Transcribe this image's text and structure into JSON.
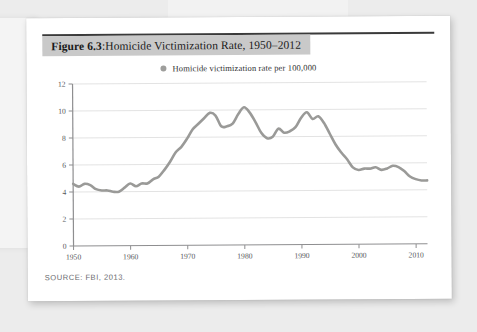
{
  "figure": {
    "label": "Figure 6.3",
    "separator": ": ",
    "title": "Homicide Victimization Rate, 1950–2012",
    "source": "SOURCE: FBI, 2013."
  },
  "colors": {
    "line": "#9a9a98",
    "title_band": "#c9c9c9",
    "grid": "#e3e3e3",
    "axis": "#8e8e90",
    "tick_text": "#55565a",
    "card": "#ffffff",
    "page_background": "#ececec"
  },
  "chart_data": {
    "type": "line",
    "title": "Homicide Victimization Rate, 1950–2012",
    "xlabel": "",
    "ylabel": "",
    "xlim": [
      1950,
      2012
    ],
    "ylim": [
      0,
      12
    ],
    "grid": true,
    "legend_position": "top-center",
    "legend": [
      "Homicide victimization rate per 100,000"
    ],
    "xticks": [
      1950,
      1960,
      1970,
      1980,
      1990,
      2000,
      2010
    ],
    "yticks": [
      0,
      2,
      4,
      6,
      8,
      10,
      12
    ],
    "series": [
      {
        "name": "Homicide victimization rate per 100,000",
        "x": [
          1950,
          1951,
          1952,
          1953,
          1954,
          1955,
          1956,
          1957,
          1958,
          1959,
          1960,
          1961,
          1962,
          1963,
          1964,
          1965,
          1966,
          1967,
          1968,
          1969,
          1970,
          1971,
          1972,
          1973,
          1974,
          1975,
          1976,
          1977,
          1978,
          1979,
          1980,
          1981,
          1982,
          1983,
          1984,
          1985,
          1986,
          1987,
          1988,
          1989,
          1990,
          1991,
          1992,
          1993,
          1994,
          1995,
          1996,
          1997,
          1998,
          1999,
          2000,
          2001,
          2002,
          2003,
          2004,
          2005,
          2006,
          2007,
          2008,
          2009,
          2010,
          2011,
          2012
        ],
        "values": [
          4.6,
          4.4,
          4.6,
          4.5,
          4.2,
          4.1,
          4.1,
          4.0,
          4.0,
          4.3,
          4.6,
          4.4,
          4.6,
          4.6,
          4.9,
          5.1,
          5.6,
          6.2,
          6.9,
          7.3,
          7.9,
          8.6,
          9.0,
          9.4,
          9.8,
          9.6,
          8.8,
          8.8,
          9.0,
          9.7,
          10.2,
          9.8,
          9.1,
          8.3,
          7.9,
          8.0,
          8.6,
          8.3,
          8.4,
          8.7,
          9.4,
          9.8,
          9.3,
          9.5,
          9.0,
          8.2,
          7.4,
          6.8,
          6.3,
          5.7,
          5.5,
          5.6,
          5.6,
          5.7,
          5.5,
          5.6,
          5.8,
          5.7,
          5.4,
          5.0,
          4.8,
          4.7,
          4.7
        ]
      }
    ]
  }
}
